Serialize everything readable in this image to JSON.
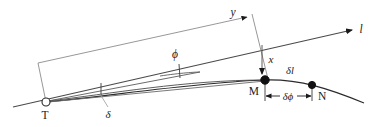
{
  "figure": {
    "type": "geometry-diagram",
    "background_color": "#ffffff",
    "stroke_color": "#3a3a3a",
    "curve_color": "#2b2b2b",
    "label_color": "#1a1a1a",
    "width": 387,
    "height": 127
  },
  "labels": {
    "y": "y",
    "x": "x",
    "l": "l",
    "phi": "ϕ",
    "delta": "δ",
    "delta_l": "δl",
    "delta_phi": "δϕ",
    "point_T": "T",
    "point_M": "M",
    "point_N": "N"
  },
  "points": [
    {
      "name": "T",
      "label": "T",
      "marker": "open-circle",
      "x": 46,
      "y": 102
    },
    {
      "name": "M",
      "label": "M",
      "marker": "filled-dot",
      "x": 265,
      "y": 80
    },
    {
      "name": "N",
      "label": "N",
      "marker": "filled-dot",
      "x": 312,
      "y": 85
    }
  ],
  "annotations": [
    {
      "name": "y-dimension",
      "label": "y",
      "kind": "arrow-right",
      "from_x": 38,
      "from_y": 63,
      "to_x": 249,
      "to_y": 17
    },
    {
      "name": "x-dimension",
      "label": "x",
      "kind": "arrow-down",
      "from_x": 263,
      "from_y": 45,
      "to_x": 263,
      "to_y": 76
    },
    {
      "name": "l-axis",
      "label": "l",
      "kind": "arrow-right",
      "to_x": 352,
      "to_y": 30
    },
    {
      "name": "phi-angle",
      "label": "ϕ",
      "kind": "angle-tick",
      "x": 176,
      "y": 56
    },
    {
      "name": "delta-angle",
      "label": "δ",
      "kind": "leader-tick",
      "x": 107,
      "y": 113
    },
    {
      "name": "delta-l-arc",
      "label": "δl",
      "kind": "arc-label",
      "x": 289,
      "y": 75
    },
    {
      "name": "delta-phi-span",
      "label": "δϕ",
      "kind": "double-arrow",
      "from_x": 265,
      "from_y": 97,
      "to_x": 312,
      "to_y": 97
    }
  ]
}
